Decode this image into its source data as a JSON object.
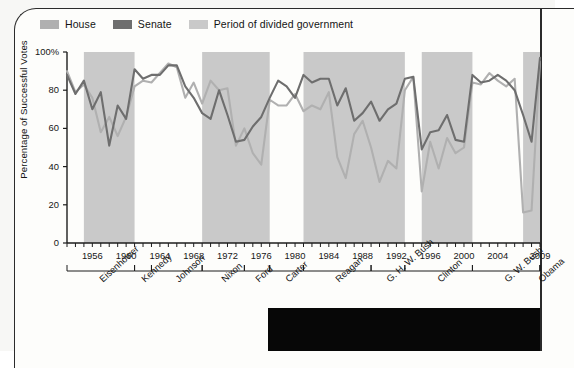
{
  "legend": {
    "items": [
      {
        "label": "House",
        "color": "#b0b0b0",
        "name": "house"
      },
      {
        "label": "Senate",
        "color": "#6e6e6e",
        "name": "senate"
      },
      {
        "label": "Period of divided government",
        "color": "#c9c9c9",
        "name": "divided"
      }
    ]
  },
  "chart_data": {
    "type": "line",
    "title": "",
    "xlabel": "",
    "ylabel": "Percentage of Successful Votes",
    "ylim": [
      0,
      100
    ],
    "xlim": [
      1953,
      2009
    ],
    "grid": false,
    "legend_position": "top-left",
    "ytick_labels": [
      "0",
      "20",
      "40",
      "60",
      "80",
      "100%"
    ],
    "ytick_values": [
      0,
      20,
      40,
      60,
      80,
      100
    ],
    "xtick_labels": [
      "1956",
      "1960",
      "1964",
      "1968",
      "1972",
      "1976",
      "1980",
      "1984",
      "1988",
      "1992",
      "1996",
      "2000",
      "2004",
      "2009"
    ],
    "xtick_values": [
      1956,
      1960,
      1964,
      1968,
      1972,
      1976,
      1980,
      1984,
      1988,
      1992,
      1996,
      2000,
      2004,
      2009
    ],
    "x": [
      1953,
      1954,
      1955,
      1956,
      1957,
      1958,
      1959,
      1960,
      1961,
      1962,
      1963,
      1964,
      1965,
      1966,
      1967,
      1968,
      1969,
      1970,
      1971,
      1972,
      1973,
      1974,
      1975,
      1976,
      1977,
      1978,
      1979,
      1980,
      1981,
      1982,
      1983,
      1984,
      1985,
      1986,
      1987,
      1988,
      1989,
      1990,
      1991,
      1992,
      1993,
      1994,
      1995,
      1996,
      1997,
      1998,
      1999,
      2000,
      2001,
      2002,
      2003,
      2004,
      2005,
      2006,
      2007,
      2008,
      2009
    ],
    "series": [
      {
        "name": "House",
        "color": "#b0b0b0",
        "values": [
          90,
          79,
          83,
          76,
          58,
          66,
          56,
          66,
          82,
          85,
          84,
          89,
          94,
          92,
          76,
          84,
          73,
          85,
          80,
          81,
          51,
          60,
          47,
          41,
          75,
          72,
          72,
          78,
          69,
          72,
          70,
          79,
          45,
          34,
          57,
          64,
          50,
          32,
          43,
          39,
          80,
          87,
          27,
          53,
          39,
          55,
          47,
          50,
          84,
          83,
          89,
          85,
          82,
          86,
          16,
          17,
          95
        ]
      },
      {
        "name": "Senate",
        "color": "#6e6e6e",
        "values": [
          88,
          78,
          85,
          70,
          79,
          51,
          72,
          65,
          91,
          86,
          88,
          88,
          93,
          93,
          82,
          76,
          68,
          65,
          80,
          67,
          53,
          54,
          61,
          66,
          76,
          85,
          82,
          76,
          88,
          84,
          86,
          86,
          72,
          81,
          64,
          68,
          74,
          64,
          70,
          73,
          86,
          87,
          49,
          58,
          59,
          67,
          54,
          53,
          88,
          84,
          85,
          88,
          85,
          80,
          67,
          53,
          97
        ]
      }
    ],
    "divided_bands": [
      {
        "start": 1955,
        "end": 1961,
        "label": "Eisenhower divided"
      },
      {
        "start": 1969,
        "end": 1977,
        "label": "Nixon-Ford divided"
      },
      {
        "start": 1981,
        "end": 1993,
        "label": "Reagan-Bush divided"
      },
      {
        "start": 1995,
        "end": 2001,
        "label": "Clinton divided"
      },
      {
        "start": 2007,
        "end": 2009,
        "label": "Bush divided"
      }
    ]
  },
  "presidents": [
    {
      "name": "Eisenhower",
      "start": 1953,
      "end": 1961
    },
    {
      "name": "Kennedy",
      "start": 1961,
      "end": 1963
    },
    {
      "name": "Johnson",
      "start": 1963,
      "end": 1969
    },
    {
      "name": "Nixon",
      "start": 1969,
      "end": 1974
    },
    {
      "name": "Ford",
      "start": 1974,
      "end": 1977
    },
    {
      "name": "Carter",
      "start": 1977,
      "end": 1981
    },
    {
      "name": "Reagan",
      "start": 1981,
      "end": 1989
    },
    {
      "name": "G. H. W. Bush",
      "start": 1989,
      "end": 1993
    },
    {
      "name": "Clinton",
      "start": 1993,
      "end": 2001
    },
    {
      "name": "G. W. Bush",
      "start": 2001,
      "end": 2009
    },
    {
      "name": "Obama",
      "start": 2009,
      "end": 2010
    }
  ]
}
